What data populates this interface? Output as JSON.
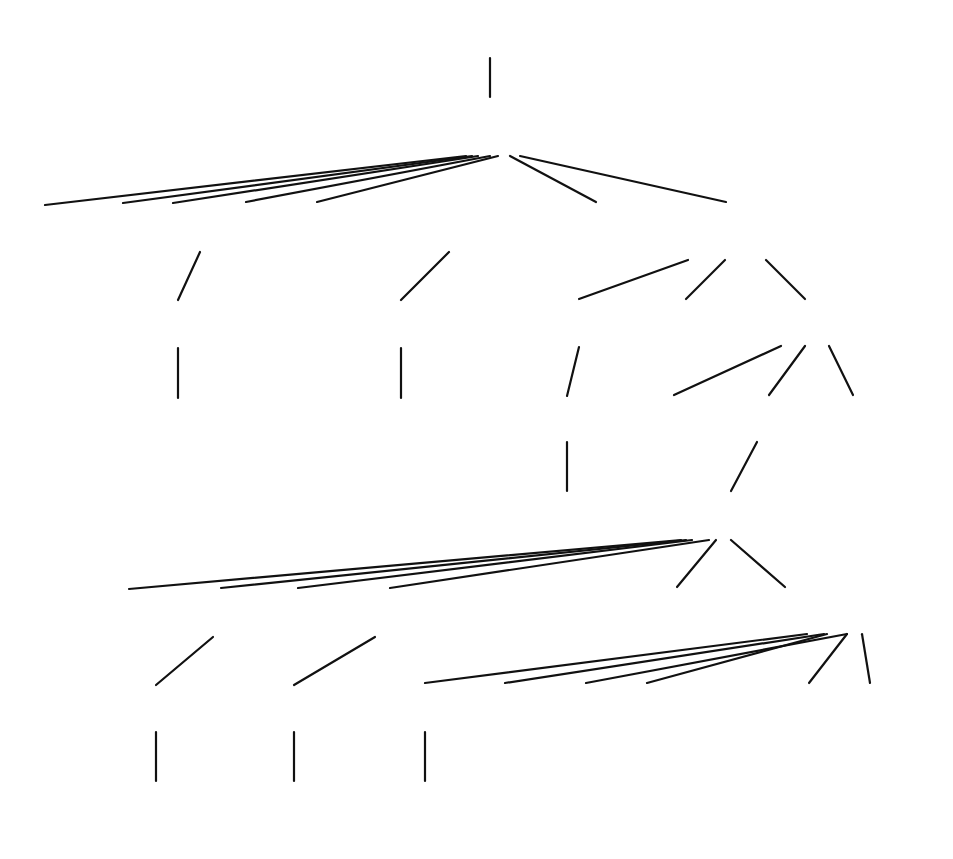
{
  "diagram": {
    "type": "parse-tree",
    "nodes": {
      "root_query": "<Query>",
      "sfw": "<SFW>",
      "select": "SELECT",
      "sellist": "<SelList>",
      "from": "FROM",
      "fromlist": "<FromList>",
      "where": "WHERE",
      "condition": "<Condition>",
      "attribute1": "<Attribute>",
      "title": "title",
      "relname1": "<RelName>",
      "starsin": "StarsIn",
      "tuple": "<Tuple>",
      "in": "IN",
      "query2": "<Query>",
      "attribute2": "<Attribute>",
      "starname": "starName",
      "lparen": "(",
      "query3": "<Query>",
      "rparen": ")",
      "sfw2": "<SFW>",
      "select2": "SELECT",
      "sellist2": "<SelList>",
      "from2": "FROM",
      "fromlist2": "<FromList>",
      "where2": "WHERE",
      "condition2": "<Condition>",
      "attribute3": "<Attribute>",
      "name": "name",
      "relname2": "<RelName>",
      "moviestar": "MovieStar",
      "attribute4": "<Attribute>",
      "like": "LIKE",
      "pattern": "<Pattern>",
      "pattern_value": "'%1960'"
    },
    "caption": "Figure 16.4: The parse tree for Fig. 7.8"
  }
}
